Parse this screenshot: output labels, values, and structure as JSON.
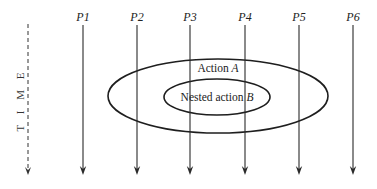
{
  "diagram": {
    "time_axis": {
      "label": "T I M E",
      "x": 28,
      "y_start": 24,
      "y_end": 175,
      "style": "dashed-arrow"
    },
    "processes": [
      {
        "label": "P1",
        "x": 83
      },
      {
        "label": "P2",
        "x": 137
      },
      {
        "label": "P3",
        "x": 190
      },
      {
        "label": "P4",
        "x": 245
      },
      {
        "label": "P5",
        "x": 299
      },
      {
        "label": "P6",
        "x": 353
      }
    ],
    "process_line": {
      "y_start": 25,
      "y_end": 175,
      "label_y": 21
    },
    "actions": [
      {
        "name": "Action A",
        "prefix": "Action ",
        "var": "A",
        "cx": 218,
        "cy": 96,
        "rx": 110,
        "ry": 37,
        "label_x": 218,
        "label_y": 72
      },
      {
        "name": "Nested action B",
        "prefix": "Nested action ",
        "var": "B",
        "cx": 217,
        "cy": 97,
        "rx": 53,
        "ry": 18,
        "label_x": 217,
        "label_y": 101
      }
    ],
    "colors": {
      "line": "#2a2a2a",
      "ellipse": "#1e1e1e",
      "background": "#ffffff"
    }
  }
}
